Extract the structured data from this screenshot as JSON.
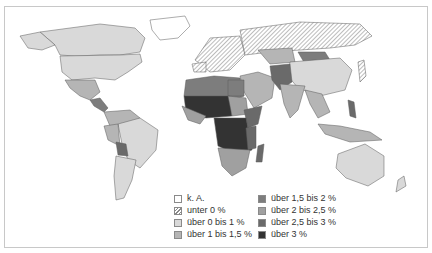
{
  "map": {
    "type": "choropleth",
    "projection": "world",
    "topic": "population growth rate per year",
    "colors": {
      "k_a": "#ffffff",
      "unter_0": "hatched",
      "0_1": "#d9d9d9",
      "1_1_5": "#b5b5b5",
      "1_5_2": "#7d7d7d",
      "2_2_5": "#a0a0a0",
      "2_5_3": "#6a6a6a",
      "3_plus": "#333333",
      "border": "#5a5a5a",
      "ocean": "#ffffff"
    },
    "legend": {
      "col1": [
        {
          "label": "k. A.",
          "key": "k_a"
        },
        {
          "label": "unter 0 %",
          "key": "unter_0"
        },
        {
          "label": "über 0 bis 1 %",
          "key": "0_1"
        },
        {
          "label": "über 1 bis 1,5 %",
          "key": "1_1_5"
        }
      ],
      "col2": [
        {
          "label": "über 1,5 bis 2 %",
          "key": "1_5_2"
        },
        {
          "label": "über 2 bis 2,5 %",
          "key": "2_2_5"
        },
        {
          "label": "über 2,5 bis 3 %",
          "key": "2_5_3"
        },
        {
          "label": "über 3 %",
          "key": "3_plus"
        }
      ]
    }
  }
}
